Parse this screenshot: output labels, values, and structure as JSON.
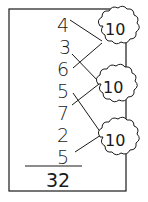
{
  "addends": [
    "4",
    "3",
    "6",
    "5",
    "7",
    "2",
    "5"
  ],
  "tens": [
    {
      "label": "10",
      "pair": [
        "4",
        "6"
      ]
    },
    {
      "label": "10",
      "pair": [
        "3",
        "7"
      ]
    },
    {
      "label": "10",
      "pair": [
        "5",
        "5"
      ]
    }
  ],
  "total": "32",
  "colors": {
    "ink": "#1a1a1a",
    "background": "#ffffff"
  }
}
